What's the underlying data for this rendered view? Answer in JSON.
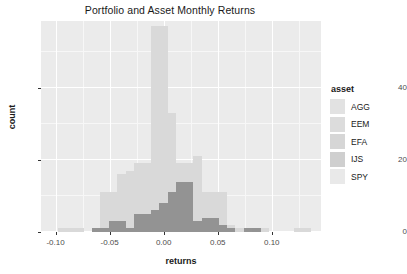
{
  "chart_data": {
    "type": "bar",
    "subtype": "overlapping-histogram",
    "title": "Portfolio and Asset Monthly Returns",
    "xlabel": "returns",
    "ylabel": "count",
    "xlim": [
      -0.1135,
      0.1455
    ],
    "ylim": [
      0,
      58.5
    ],
    "xticks": [
      -0.1,
      -0.05,
      0.0,
      0.05,
      0.1
    ],
    "xtick_labels": [
      "-0.10",
      "-0.05",
      "0.00",
      "0.05",
      "0.10"
    ],
    "yticks": [
      0,
      20,
      40
    ],
    "ytick_labels": [
      "0",
      "20",
      "40"
    ],
    "grid": true,
    "grid_major_color": "#ffffff",
    "grid_minor_color": "#f7f7f7",
    "panel_color": "#ebebeb",
    "legend_position": "right",
    "legend_title": "asset",
    "binwidth": 0.0078,
    "series": [
      {
        "name": "AGG",
        "color": "#e2e2e2",
        "bins": [
          -0.0585,
          -0.0507,
          -0.0429,
          -0.0351,
          -0.0273,
          -0.0195,
          -0.0117,
          -0.0039,
          0.0039,
          0.0117,
          0.0195,
          0.0273,
          0.0351
        ],
        "values": [
          0,
          0,
          0,
          1,
          2,
          5,
          14,
          33,
          22,
          8,
          3,
          1,
          0
        ]
      },
      {
        "name": "EEM",
        "color": "#dcdcdc",
        "bins": [
          -0.0897,
          -0.0819,
          -0.0741,
          -0.0663,
          -0.0585,
          -0.0507,
          -0.0429,
          -0.0351,
          -0.0273,
          -0.0195,
          -0.0117,
          -0.0039,
          0.0039,
          0.0117,
          0.0195,
          0.0273,
          0.0351,
          0.0429,
          0.0507,
          0.0585,
          0.0663,
          0.0741,
          0.0819,
          0.0897,
          0.1209
        ],
        "values": [
          1,
          1,
          0,
          0,
          2,
          4,
          3,
          5,
          6,
          7,
          9,
          11,
          10,
          8,
          7,
          5,
          4,
          3,
          2,
          2,
          1,
          0,
          1,
          1,
          1
        ]
      },
      {
        "name": "EFA",
        "color": "#d6d6d6",
        "bins": [
          -0.0663,
          -0.0585,
          -0.0507,
          -0.0429,
          -0.0351,
          -0.0273,
          -0.0195,
          -0.0117,
          -0.0039,
          0.0039,
          0.0117,
          0.0195,
          0.0273,
          0.0351,
          0.0429,
          0.0507,
          0.0585,
          0.0663
        ],
        "values": [
          1,
          2,
          4,
          5,
          6,
          8,
          9,
          12,
          14,
          12,
          9,
          8,
          6,
          5,
          4,
          3,
          2,
          1
        ]
      },
      {
        "name": "IJS",
        "color": "#cfcfcf",
        "bins": [
          -0.0975,
          -0.0897,
          -0.0819,
          -0.0741,
          -0.0663,
          -0.0585,
          -0.0507,
          -0.0429,
          -0.0351,
          -0.0273,
          -0.0195,
          -0.0117,
          -0.0039,
          0.0039,
          0.0117,
          0.0195,
          0.0273,
          0.0351,
          0.0429,
          0.0507,
          0.0585,
          0.0663,
          0.0819
        ],
        "values": [
          1,
          1,
          1,
          0,
          1,
          3,
          5,
          6,
          7,
          8,
          9,
          10,
          11,
          9,
          8,
          7,
          6,
          4,
          3,
          2,
          2,
          1,
          1
        ]
      },
      {
        "name": "SPY",
        "color": "#e9e9e9",
        "bins": [
          -0.0819,
          -0.0741,
          -0.0663,
          -0.0585,
          -0.0507,
          -0.0429,
          -0.0351,
          -0.0273,
          -0.0195,
          -0.0117,
          -0.0039,
          0.0039,
          0.0117,
          0.0195,
          0.0273,
          0.0351,
          0.0429,
          0.0507,
          0.0585
        ],
        "values": [
          1,
          0,
          1,
          2,
          4,
          6,
          8,
          9,
          10,
          12,
          13,
          11,
          9,
          8,
          6,
          4,
          3,
          2,
          1
        ]
      }
    ],
    "stacked_outline": {
      "comment": "Rendered silhouette of overlapping semi-transparent histograms as seen in the image",
      "bins": [
        -0.0975,
        -0.0897,
        -0.0819,
        -0.0741,
        -0.0663,
        -0.0585,
        -0.0507,
        -0.0429,
        -0.0351,
        -0.0273,
        -0.0195,
        -0.0117,
        -0.0039,
        0.0039,
        0.0117,
        0.0195,
        0.0273,
        0.0351,
        0.0429,
        0.0507,
        0.0585,
        0.0663,
        0.0741,
        0.0819,
        0.0897,
        0.1209,
        0.1287
      ],
      "values": [
        1,
        1,
        1,
        0,
        1,
        11,
        11,
        16,
        17,
        19,
        19,
        57,
        57,
        33,
        19,
        19,
        21,
        11,
        11,
        11,
        2,
        1,
        0,
        1,
        1,
        1,
        1
      ]
    },
    "portfolio_overlay": {
      "name": "Portfolio",
      "color": "#8f8f8f",
      "bins": [
        -0.0663,
        -0.0585,
        -0.0507,
        -0.0429,
        -0.0351,
        -0.0273,
        -0.0195,
        -0.0117,
        -0.0039,
        0.0039,
        0.0117,
        0.0195,
        0.0273,
        0.0351,
        0.0429,
        0.0507,
        0.0585,
        0.0741,
        0.0819
      ],
      "values": [
        1,
        1,
        3,
        3,
        1,
        5,
        5,
        6,
        8,
        11,
        14,
        14,
        3,
        4,
        4,
        2,
        1,
        1,
        1
      ]
    }
  },
  "legend": {
    "title": "asset",
    "items": [
      {
        "label": "AGG",
        "color": "#e2e2e2"
      },
      {
        "label": "EEM",
        "color": "#dcdcdc"
      },
      {
        "label": "EFA",
        "color": "#d6d6d6"
      },
      {
        "label": "IJS",
        "color": "#cfcfcf"
      },
      {
        "label": "SPY",
        "color": "#e9e9e9"
      }
    ]
  }
}
